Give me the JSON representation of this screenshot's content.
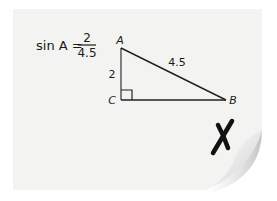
{
  "equation": {
    "lhs": "sin A =",
    "numerator": "2",
    "denominator": "4.5"
  },
  "triangle": {
    "vertices": {
      "A": "A",
      "B": "B",
      "C": "C"
    },
    "side_AC": "2",
    "side_AB": "4.5",
    "right_angle_at": "C"
  },
  "mark": {
    "symbol": "X",
    "meaning": "incorrect"
  },
  "colors": {
    "paper": "#f3f3f1",
    "ink": "#1a1a1a",
    "shadow": "#c9c9c9"
  }
}
